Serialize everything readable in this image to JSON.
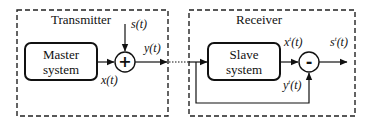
{
  "diagram": {
    "type": "block-diagram",
    "transmitter": {
      "title": "Transmitter",
      "block": {
        "line1": "Master",
        "line2": "system"
      },
      "summer": {
        "operator": "+"
      },
      "labels": {
        "input": "s(t)",
        "state": "x(t)",
        "output": "y(t)"
      }
    },
    "receiver": {
      "title": "Receiver",
      "block": {
        "line1": "Slave",
        "line2": "system"
      },
      "subtractor": {
        "operator": "-"
      },
      "labels": {
        "slave_out_base": "x",
        "slave_out_sup": "t",
        "slave_out_arg": "(t)",
        "feedback_base": "y",
        "feedback_sup": "t",
        "feedback_arg": "(t)",
        "recovered_base": "s",
        "recovered_sup": "t",
        "recovered_arg": "(t)"
      }
    },
    "channel": {
      "style": "dotted"
    },
    "colors": {
      "stroke": "#111111",
      "background": "#ffffff"
    }
  }
}
